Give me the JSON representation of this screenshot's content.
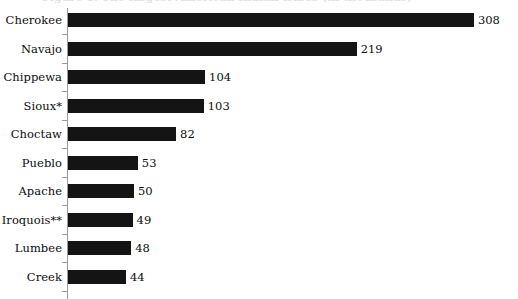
{
  "figure": {
    "title": "Figure 1.  The largest American Indian tribes (in thousands)",
    "title_visible": false,
    "background_color": "#ffffff",
    "bar_color": "#141414",
    "axis_color": "#9b9b9b",
    "text_color": "#0d0d0d"
  },
  "chart_data": {
    "type": "bar",
    "orientation": "horizontal",
    "title": "Figure 1.  The largest American Indian tribes (in thousands)",
    "xlabel": "",
    "ylabel": "",
    "xlim": [
      0,
      308
    ],
    "grid": false,
    "legend": null,
    "categories": [
      "Cherokee",
      "Navajo",
      "Chippewa",
      "Sioux*",
      "Choctaw",
      "Pueblo",
      "Apache",
      "Iroquois**",
      "Lumbee",
      "Creek"
    ],
    "values": [
      308,
      219,
      104,
      103,
      82,
      53,
      50,
      49,
      48,
      44
    ],
    "value_labels": [
      "308",
      "219",
      "104",
      "103",
      "82",
      "53",
      "50",
      "49",
      "48",
      "44"
    ],
    "footnote_markers": {
      "single_asterisk": "Sioux*",
      "double_asterisk": "Iroquois**"
    }
  },
  "layout": {
    "axis_x": 67,
    "bar_start_x": 68,
    "px_per_unit": 1.318,
    "first_bar_top": 13,
    "row_pitch": 28.5,
    "bar_height": 14
  }
}
